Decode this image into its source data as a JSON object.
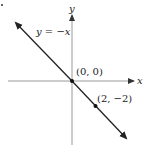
{
  "diagram": {
    "axes": {
      "x_label": "x",
      "y_label": "y",
      "axis_color": "#9a9a9a"
    },
    "line": {
      "label": "y = −x",
      "color": "#222222",
      "equation": "y = -x"
    },
    "points": [
      {
        "label": "(0, 0)",
        "x": 0,
        "y": 0
      },
      {
        "label": "(2, −2)",
        "x": 2,
        "y": -2
      }
    ]
  }
}
